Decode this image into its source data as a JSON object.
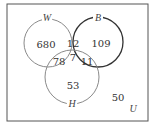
{
  "diagram": {
    "type": "venn",
    "universe_label": "U",
    "sets": [
      {
        "label": "W",
        "color": "#8a8a8a"
      },
      {
        "label": "B",
        "color": "#333333"
      },
      {
        "label": "H",
        "color": "#8a8a8a"
      }
    ],
    "regions": {
      "W_only": "680",
      "B_only": "109",
      "H_only": "53",
      "W_and_B_only": "12",
      "W_and_H_only": "78",
      "B_and_H_only": "11",
      "W_and_B_and_H": "7",
      "outside": "50"
    }
  }
}
